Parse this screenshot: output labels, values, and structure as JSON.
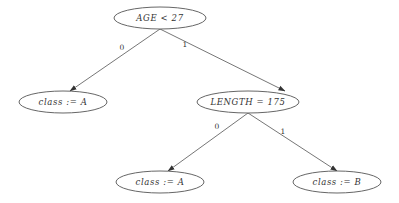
{
  "diagram": {
    "type": "decision-tree",
    "nodes": [
      {
        "id": "root",
        "label": "AGE < 27",
        "cx": 160,
        "cy": 18,
        "rx": 46,
        "ry": 11
      },
      {
        "id": "left",
        "label": "class := A",
        "cx": 63,
        "cy": 102,
        "rx": 44,
        "ry": 11
      },
      {
        "id": "right",
        "label": "LENGTH = 175",
        "cx": 292,
        "cy": 102,
        "rx": 51,
        "ry": 11
      },
      {
        "id": "right-left",
        "label": "class := A",
        "cx": 160,
        "cy": 182,
        "rx": 44,
        "ry": 11
      },
      {
        "id": "right-right",
        "label": "class := B",
        "cx": 337,
        "cy": 182,
        "rx": 44,
        "ry": 11
      }
    ],
    "edges": [
      {
        "from": "root",
        "to": "left",
        "label": "0"
      },
      {
        "from": "root",
        "to": "right",
        "label": "1"
      },
      {
        "from": "right",
        "to": "right-left",
        "label": "0"
      },
      {
        "from": "right",
        "to": "right-right",
        "label": "1"
      }
    ]
  },
  "labels": {
    "root": "AGE < 27",
    "left": "class := A",
    "right": "LENGTH = 175",
    "right_left": "class := A",
    "right_right": "class := B",
    "edge_root_left": "0",
    "edge_root_right": "1",
    "edge_right_left": "0",
    "edge_right_right": "1"
  }
}
